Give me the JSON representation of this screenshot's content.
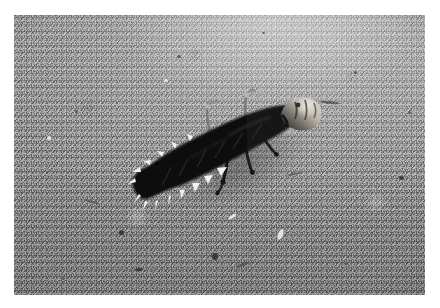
{
  "image": {
    "title": "Beetle larva on granular light surface",
    "kind": "black-and-white macro photograph",
    "subject": "dark elongated beetle larva with pale lateral setae",
    "background_description": "coarse granular light grey surface with scattered dark specks",
    "orientation": "head toward upper right, abdomen toward lower left",
    "frame": {
      "margin_color": "#ffffff",
      "plate_left": 14,
      "plate_top": 15,
      "plate_width": 411,
      "plate_height": 280
    },
    "palette": {
      "background_light": "#e2e2e2",
      "background_mid": "#bcbcbc",
      "background_dark": "#9b9b9b",
      "body_black": "#0d0d0d",
      "body_dark_grey": "#2a2a2a",
      "head_capsule": "#8e8a84",
      "head_highlight": "#d8d4cc",
      "setae_white": "#f4f2ee",
      "speck_dark": "#3a3a3a"
    },
    "anatomy": {
      "segments_visible": 9,
      "setae_count": 14,
      "legs_visible": 3,
      "antennae_visible": 2,
      "head_label": "head capsule",
      "thorax_label": "thorax",
      "abdomen_label": "abdomen",
      "setae_label": "lateral setae",
      "leg_label": "thoracic leg",
      "antenna_label": "antenna"
    },
    "specks": [
      {
        "x": 105,
        "y": 215,
        "w": 5,
        "h": 5,
        "tone": "dark"
      },
      {
        "x": 121,
        "y": 253,
        "w": 8,
        "h": 3,
        "tone": "dark"
      },
      {
        "x": 198,
        "y": 238,
        "w": 6,
        "h": 7,
        "tone": "dark"
      },
      {
        "x": 385,
        "y": 161,
        "w": 5,
        "h": 4,
        "tone": "dark"
      },
      {
        "x": 47,
        "y": 262,
        "w": 4,
        "h": 3,
        "tone": "soft"
      },
      {
        "x": 286,
        "y": 203,
        "w": 3,
        "h": 3,
        "tone": "soft"
      },
      {
        "x": 340,
        "y": 56,
        "w": 3,
        "h": 3,
        "tone": "soft"
      },
      {
        "x": 163,
        "y": 40,
        "w": 4,
        "h": 3,
        "tone": "soft"
      },
      {
        "x": 61,
        "y": 95,
        "w": 3,
        "h": 3,
        "tone": "soft"
      },
      {
        "x": 330,
        "y": 247,
        "w": 4,
        "h": 3,
        "tone": "soft"
      },
      {
        "x": 248,
        "y": 17,
        "w": 3,
        "h": 2,
        "tone": "soft"
      },
      {
        "x": 394,
        "y": 96,
        "w": 3,
        "h": 3,
        "tone": "soft"
      }
    ],
    "streaks": [
      {
        "x": 222,
        "y": 248,
        "w": 14,
        "h": 3,
        "rot": -18
      },
      {
        "x": 306,
        "y": 86,
        "w": 20,
        "h": 3,
        "rot": 6
      },
      {
        "x": 70,
        "y": 186,
        "w": 16,
        "h": 2,
        "rot": 14
      },
      {
        "x": 272,
        "y": 158,
        "w": 17,
        "h": 2,
        "rot": -8
      }
    ],
    "highlights": [
      {
        "x": 264,
        "y": 214,
        "w": 5,
        "h": 11,
        "rot": 22
      },
      {
        "x": 214,
        "y": 200,
        "w": 9,
        "h": 3,
        "rot": -34
      },
      {
        "x": 33,
        "y": 121,
        "w": 4,
        "h": 4,
        "rot": 0
      },
      {
        "x": 150,
        "y": 64,
        "w": 4,
        "h": 3,
        "rot": 0
      }
    ]
  }
}
